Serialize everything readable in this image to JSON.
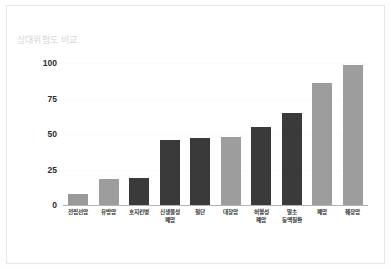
{
  "figure": {
    "background_color": "#ffffff",
    "border_color": "#e7e7e7"
  },
  "chart_data": {
    "type": "bar",
    "title": "상대위험도 비교",
    "xlabel": "",
    "ylabel": "",
    "ylim": [
      0,
      105
    ],
    "yticks": [
      0,
      25,
      50,
      75,
      100
    ],
    "ytick_labels": [
      "0",
      "25",
      "50",
      "75",
      "100"
    ],
    "grid": false,
    "legend": "none",
    "categories": [
      "전립선암",
      "유방암",
      "호지킨병",
      "신생물성\n폐암",
      "절단",
      "대장암",
      "허혈성\n폐암",
      "말초\n동맥질환",
      "폐암",
      "췌장암"
    ],
    "values": [
      8,
      18,
      19,
      46,
      47,
      48,
      55,
      65,
      86,
      99
    ],
    "bar_colors": [
      "#999999",
      "#9d9d9d",
      "#3a3a3a",
      "#3a3a3a",
      "#3a3a3a",
      "#9d9d9d",
      "#3a3a3a",
      "#3a3a3a",
      "#9d9d9d",
      "#9d9d9d"
    ],
    "palette": {
      "light": "#9d9d9d",
      "dark": "#3a3a3a",
      "axis": "#b4b4b4",
      "tick_text": "#2b2b2b",
      "title_text": "#d6d6d6"
    }
  }
}
